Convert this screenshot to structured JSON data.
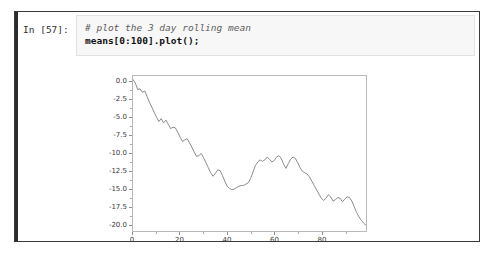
{
  "cell": {
    "prompt_label": "In [57]:",
    "code_lines": [
      {
        "kind": "comment",
        "text": "# plot the 3 day rolling mean"
      },
      {
        "kind": "statement",
        "text": "means[0:100].plot();"
      }
    ]
  },
  "colors": {
    "line": "#8a8a8a",
    "axes_frame": "#b9b9b9",
    "tick": "#8c8c8c",
    "tick_label": "#3a3a3a",
    "cell_border": "#3a3a3a",
    "code_background": "#f7f7f7",
    "page_background": "#ffffff"
  },
  "chart_data": {
    "type": "line",
    "title": "",
    "xlabel": "",
    "ylabel": "",
    "xlim": [
      0,
      99
    ],
    "ylim": [
      -21.0,
      0.8
    ],
    "grid": false,
    "legend": null,
    "xticks": [
      0,
      20,
      40,
      60,
      80
    ],
    "xtick_labels": [
      "0",
      "20",
      "40",
      "60",
      "80"
    ],
    "xticks_minor": [
      10,
      30,
      50,
      70,
      90
    ],
    "yticks": [
      0.0,
      -2.5,
      -5.0,
      -7.5,
      -10.0,
      -12.5,
      -15.0,
      -17.5,
      -20.0
    ],
    "ytick_labels": [
      "0.0",
      "-2.5",
      "-5.0",
      "-7.5",
      "-10.0",
      "-12.5",
      "-15.0",
      "-17.5",
      "-20.0"
    ],
    "series": [
      {
        "name": "means[0:100]",
        "x": [
          0,
          1,
          2,
          3,
          4,
          5,
          6,
          7,
          8,
          9,
          10,
          11,
          12,
          13,
          14,
          15,
          16,
          17,
          18,
          19,
          20,
          21,
          22,
          23,
          24,
          25,
          26,
          27,
          28,
          29,
          30,
          31,
          32,
          33,
          34,
          35,
          36,
          37,
          38,
          39,
          40,
          41,
          42,
          43,
          44,
          45,
          46,
          47,
          48,
          49,
          50,
          51,
          52,
          53,
          54,
          55,
          56,
          57,
          58,
          59,
          60,
          61,
          62,
          63,
          64,
          65,
          66,
          67,
          68,
          69,
          70,
          71,
          72,
          73,
          74,
          75,
          76,
          77,
          78,
          79,
          80,
          81,
          82,
          83,
          84,
          85,
          86,
          87,
          88,
          89,
          90,
          91,
          92,
          93,
          94,
          95,
          96,
          97,
          98,
          99
        ],
        "values": [
          0.3,
          -0.2,
          -1.1,
          -1.0,
          -1.5,
          -1.3,
          -2.1,
          -2.9,
          -3.6,
          -4.3,
          -5.0,
          -5.6,
          -5.2,
          -5.8,
          -5.4,
          -6.0,
          -6.6,
          -6.4,
          -6.5,
          -7.1,
          -7.8,
          -8.4,
          -8.2,
          -8.0,
          -8.6,
          -9.2,
          -9.9,
          -10.5,
          -10.4,
          -10.1,
          -10.7,
          -11.4,
          -12.1,
          -12.8,
          -13.3,
          -12.9,
          -12.4,
          -12.5,
          -13.2,
          -14.0,
          -14.7,
          -15.0,
          -15.2,
          -15.1,
          -14.9,
          -14.7,
          -14.6,
          -14.6,
          -14.4,
          -14.2,
          -13.6,
          -12.7,
          -11.8,
          -11.3,
          -11.0,
          -11.2,
          -11.0,
          -10.6,
          -10.9,
          -11.3,
          -11.1,
          -10.6,
          -10.4,
          -10.8,
          -11.6,
          -12.2,
          -11.5,
          -10.9,
          -10.6,
          -10.8,
          -11.4,
          -12.1,
          -12.6,
          -12.8,
          -13.0,
          -13.4,
          -14.0,
          -14.6,
          -15.2,
          -15.8,
          -16.4,
          -16.7,
          -16.4,
          -15.9,
          -16.2,
          -16.8,
          -16.6,
          -16.3,
          -16.4,
          -16.9,
          -16.5,
          -16.2,
          -16.3,
          -16.8,
          -17.6,
          -18.4,
          -19.0,
          -19.5,
          -19.9,
          -20.2
        ]
      }
    ]
  }
}
